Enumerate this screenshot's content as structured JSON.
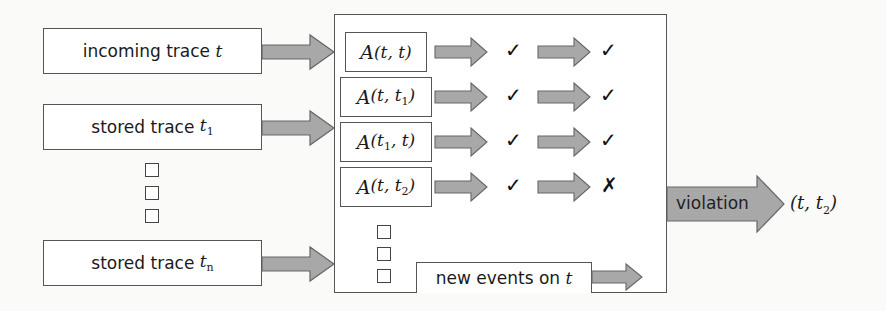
{
  "colors": {
    "arrow_fill": "#a8a8a8",
    "arrow_stroke": "#666666",
    "box_border": "#555555",
    "background": "#fafaf8"
  },
  "inputs": [
    {
      "label": "incoming trace",
      "var": "t",
      "sub": ""
    },
    {
      "label": "stored trace",
      "var": "t",
      "sub": "1"
    },
    {
      "label": "stored trace",
      "var": "t",
      "sub": "n"
    }
  ],
  "ellipsis_icon": "square-dots",
  "automata": [
    {
      "fn": "A",
      "args": [
        "t",
        "",
        "t",
        ""
      ],
      "mark1": "✓",
      "mark2": "✓"
    },
    {
      "fn": "A",
      "args": [
        "t",
        "",
        "t",
        "1"
      ],
      "mark1": "✓",
      "mark2": "✓"
    },
    {
      "fn": "A",
      "args": [
        "t",
        "1",
        "t",
        ""
      ],
      "mark1": "✓",
      "mark2": "✓"
    },
    {
      "fn": "A",
      "args": [
        "t",
        "",
        "t",
        "2"
      ],
      "mark1": "✓",
      "mark2": "✗"
    }
  ],
  "new_events": {
    "label": "new events on",
    "var": "t"
  },
  "output": {
    "label": "violation",
    "result_var1": "t",
    "result_var2": "t",
    "result_sub": "2"
  }
}
